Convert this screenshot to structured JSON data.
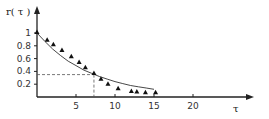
{
  "chart_data": {
    "type": "scatter",
    "title": "",
    "xlabel": "τ",
    "ylabel": "r( τ )",
    "xlim": [
      0,
      27
    ],
    "ylim": [
      0,
      1.05
    ],
    "x_ticks": [
      5,
      10,
      15,
      20
    ],
    "y_ticks": [
      1,
      0.8,
      0.6,
      0.4,
      0.2
    ],
    "y_tick_labels": [
      "1",
      "0.8",
      "0.6",
      "0.4",
      "0.2"
    ],
    "x_tick_labels": [
      "5",
      "10",
      "15",
      "20"
    ],
    "grid": false,
    "legend": null,
    "series": [
      {
        "name": "measured",
        "marker": "triangle",
        "x": [
          0,
          1.3,
          2.1,
          3.2,
          4.4,
          5.4,
          6.2,
          7.3,
          8.2,
          9.1,
          10.4,
          12.1,
          12.8,
          13.9,
          15.2
        ],
        "y": [
          1.0,
          0.88,
          0.81,
          0.72,
          0.62,
          0.53,
          0.45,
          0.36,
          0.27,
          0.19,
          0.12,
          0.08,
          0.07,
          0.06,
          0.06
        ]
      },
      {
        "name": "fit",
        "style": "line",
        "function": "exp(-tau/7)",
        "x": [
          0,
          1,
          2,
          3,
          4,
          5,
          6,
          7,
          8,
          9,
          10,
          11,
          12,
          13,
          14,
          15
        ],
        "y": [
          1.0,
          0.87,
          0.75,
          0.65,
          0.56,
          0.49,
          0.42,
          0.37,
          0.32,
          0.28,
          0.24,
          0.21,
          0.18,
          0.16,
          0.14,
          0.12
        ]
      }
    ],
    "annotations": [
      {
        "type": "dashed-guide",
        "x": 7.3,
        "y": 0.35,
        "description": "dashed lines marking r=0.35 at τ≈7.3"
      }
    ]
  },
  "labels": {
    "y_axis": "r( τ )",
    "x_axis": "τ"
  }
}
